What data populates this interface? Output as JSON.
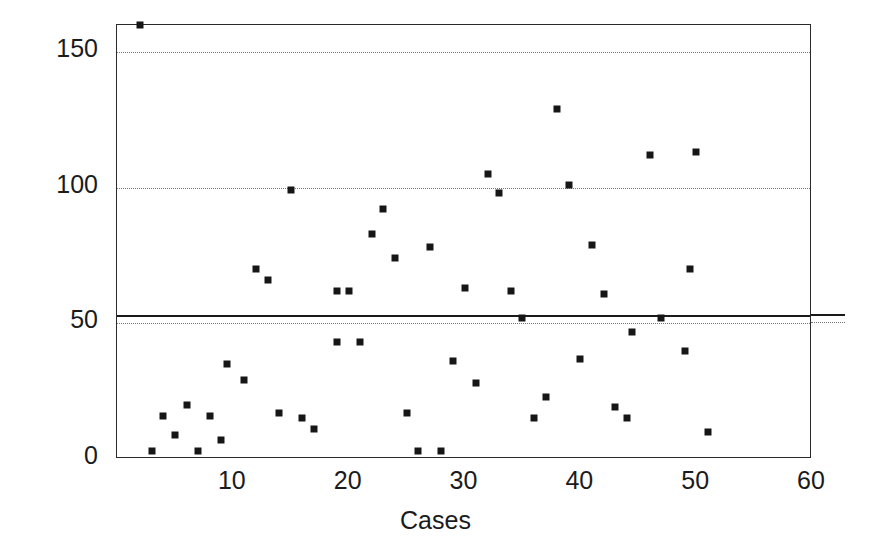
{
  "chart_data": {
    "type": "scatter",
    "title": "",
    "xlabel": "Cases",
    "ylabel": "Minutes",
    "xlim": [
      0,
      60
    ],
    "ylim": [
      0,
      160
    ],
    "xticks": [
      10,
      20,
      30,
      40,
      50,
      60
    ],
    "yticks": [
      0,
      50,
      100,
      150
    ],
    "grid": "horizontal dotted gridlines at 50, 100, 150",
    "legend_position": "right of plot, inline with reference lines",
    "marker": {
      "shape": "square",
      "color": "#161616",
      "size_px": 7
    },
    "reference_lines": [
      {
        "label": "21 abl",
        "value": 53,
        "style": "solid",
        "color": "#1a1a1a"
      },
      {
        "label": "30 abl",
        "value": 50,
        "style": "dotted",
        "color": "#777777"
      }
    ],
    "series": [
      {
        "name": "Minutes per case",
        "points": [
          {
            "x": 2,
            "y": 160
          },
          {
            "x": 3,
            "y": 3
          },
          {
            "x": 4,
            "y": 16
          },
          {
            "x": 5,
            "y": 9
          },
          {
            "x": 6,
            "y": 20
          },
          {
            "x": 7,
            "y": 3
          },
          {
            "x": 8,
            "y": 16
          },
          {
            "x": 9,
            "y": 7
          },
          {
            "x": 9.5,
            "y": 35
          },
          {
            "x": 11,
            "y": 29
          },
          {
            "x": 12,
            "y": 70
          },
          {
            "x": 13,
            "y": 66
          },
          {
            "x": 14,
            "y": 17
          },
          {
            "x": 15,
            "y": 99
          },
          {
            "x": 16,
            "y": 15
          },
          {
            "x": 17,
            "y": 11
          },
          {
            "x": 19,
            "y": 62
          },
          {
            "x": 19,
            "y": 43
          },
          {
            "x": 20,
            "y": 62
          },
          {
            "x": 21,
            "y": 43
          },
          {
            "x": 22,
            "y": 83
          },
          {
            "x": 23,
            "y": 92
          },
          {
            "x": 24,
            "y": 74
          },
          {
            "x": 25,
            "y": 17
          },
          {
            "x": 26,
            "y": 3
          },
          {
            "x": 27,
            "y": 78
          },
          {
            "x": 28,
            "y": 3
          },
          {
            "x": 29,
            "y": 36
          },
          {
            "x": 30,
            "y": 63
          },
          {
            "x": 31,
            "y": 28
          },
          {
            "x": 32,
            "y": 105
          },
          {
            "x": 33,
            "y": 98
          },
          {
            "x": 34,
            "y": 62
          },
          {
            "x": 35,
            "y": 52
          },
          {
            "x": 36,
            "y": 15
          },
          {
            "x": 37,
            "y": 23
          },
          {
            "x": 38,
            "y": 129
          },
          {
            "x": 39,
            "y": 101
          },
          {
            "x": 40,
            "y": 37
          },
          {
            "x": 41,
            "y": 79
          },
          {
            "x": 42,
            "y": 61
          },
          {
            "x": 43,
            "y": 19
          },
          {
            "x": 44,
            "y": 15
          },
          {
            "x": 44.5,
            "y": 47
          },
          {
            "x": 46,
            "y": 112
          },
          {
            "x": 47,
            "y": 52
          },
          {
            "x": 49,
            "y": 40
          },
          {
            "x": 49.5,
            "y": 70
          },
          {
            "x": 50,
            "y": 113
          },
          {
            "x": 51,
            "y": 10
          }
        ]
      }
    ]
  },
  "axes": {
    "ylabel": "Minutes",
    "xlabel": "Cases",
    "ytick_labels": [
      "0",
      "50",
      "100",
      "150"
    ],
    "xtick_labels": [
      "10",
      "20",
      "30",
      "40",
      "50",
      "60"
    ]
  },
  "annotations": {
    "upper_line_label": "21 abl",
    "lower_line_label": "30 abl"
  }
}
